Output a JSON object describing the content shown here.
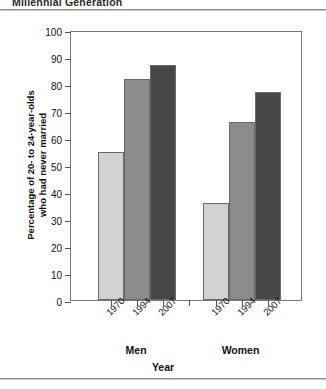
{
  "page": {
    "running_header": "Millennial Generation"
  },
  "chart_data": {
    "type": "bar",
    "title": "",
    "xlabel": "Year",
    "ylabel": "Percentage of 20- to 24-year-olds who had never married",
    "ylabel_line1": "Percentage of 20- to 24-year-olds",
    "ylabel_line2": "who had never married",
    "ylim": [
      0,
      100
    ],
    "ytick_step": 10,
    "yticks": [
      0,
      10,
      20,
      30,
      40,
      50,
      60,
      70,
      80,
      90,
      100
    ],
    "ytick_labels": [
      "0",
      "10",
      "20",
      "30",
      "40",
      "50",
      "60",
      "70",
      "80",
      "90",
      "100"
    ],
    "grid": false,
    "legend": "none",
    "groups": [
      "Men",
      "Women"
    ],
    "categories": [
      "1970",
      "1994",
      "2007"
    ],
    "series": [
      {
        "name": "Men",
        "categories": [
          "1970",
          "1994",
          "2007"
        ],
        "values": [
          55,
          82,
          87
        ]
      },
      {
        "name": "Women",
        "categories": [
          "1970",
          "1994",
          "2007"
        ],
        "values": [
          36,
          66,
          77
        ]
      }
    ],
    "bar_colors": {
      "1970": "#d2d2d2",
      "1994": "#8c8c8c",
      "2007": "#474747"
    },
    "bar_border_color": "#6a6a6a",
    "axis_color": "#777777"
  }
}
